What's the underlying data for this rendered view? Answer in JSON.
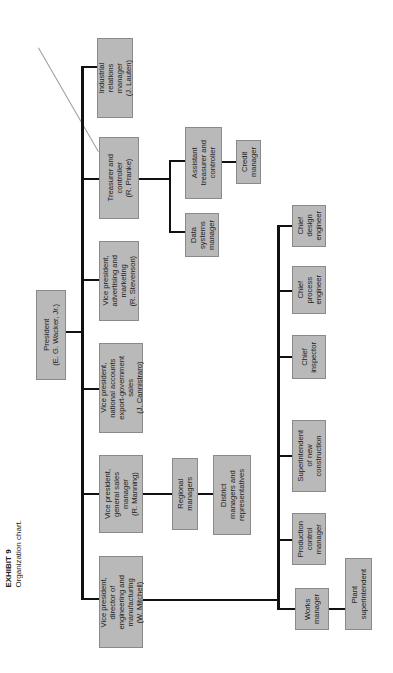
{
  "caption": {
    "exhibit": "EXHIBIT 9",
    "title": "Organization chart."
  },
  "nodes": {
    "president": "President\n(E. G. Wacker, Jr.)",
    "vp_engineering": "Vice president,\ndirector of\nengineering and\nmanufacturing\n(W. Mitchell)",
    "vp_sales": "Vice president,\ngeneral sales\nmanager\n(R. Manning)",
    "vp_national": "Vice president,\nnational accounts\nexport-government\nsales\n(J. Cannistraro)",
    "vp_advertising": "Vice president,\nadvertising and\nmarketing\n(R. Stevenson)",
    "treasurer": "Treasurer and\ncontroller\n(R. Pranke)",
    "industrial_relations": "Industrial\nrelations\nmanager\n(J. Lauten)",
    "regional_managers": "Regional\nmanagers",
    "district_managers": "District\nmanagers and\nrepresentatives",
    "data_systems": "Data\nsystems\nmanager",
    "assistant_treasurer": "Assistant\ntreasurer and\ncontroller",
    "credit_manager": "Credit\nmanager",
    "works_manager": "Works\nmanager",
    "plant_superintendent": "Plant\nsuperintendent",
    "production_control": "Production\ncontrol\nmanager",
    "superintendent_construction": "Superintendent\nof new\nconstruction",
    "chief_inspector": "Chief\ninspector",
    "chief_process": "Chief\nprocess\nengineer",
    "chief_design": "Chief\ndesign\nengineer"
  },
  "colors": {
    "box_fill": "#b9b9b9",
    "line": "#111111"
  }
}
